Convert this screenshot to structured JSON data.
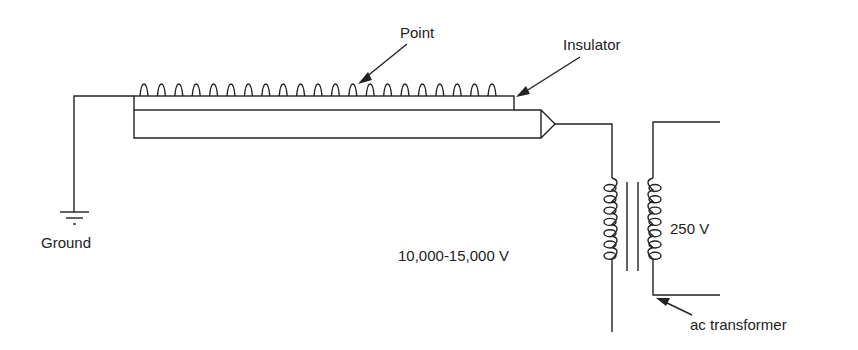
{
  "diagram": {
    "labels": {
      "point": "Point",
      "insulator": "Insulator",
      "ground": "Ground",
      "high_voltage": "10,000-15,000 V",
      "low_voltage": "250 V",
      "transformer": "ac transformer"
    },
    "point_count": 21,
    "line_color": "#222222"
  }
}
